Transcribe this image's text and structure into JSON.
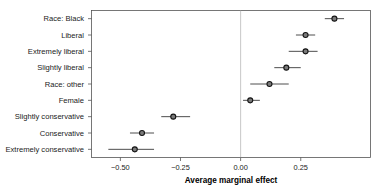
{
  "chart_data": {
    "type": "scatter",
    "title": "",
    "xlabel": "Average marginal effect",
    "ylabel": "",
    "xlim": [
      -0.62,
      0.54
    ],
    "xticks": [
      -0.5,
      -0.25,
      0.0,
      0.25
    ],
    "xticklabels": [
      "−0.50",
      "−0.25",
      "0.00",
      "0.25"
    ],
    "grid": false,
    "legend": null,
    "reference_line": 0.0,
    "orientation": "horizontal",
    "error_bars": "confidence-interval",
    "categories": [
      "Race: Black",
      "Liberal",
      "Extremely liberal",
      "Slightly liberal",
      "Race: other",
      "Female",
      "Slightly conservative",
      "Conservative",
      "Extremely conservative"
    ],
    "values": [
      0.39,
      0.27,
      0.27,
      0.19,
      0.12,
      0.04,
      -0.28,
      -0.41,
      -0.44
    ],
    "ci_low": [
      -0.35,
      0.23,
      0.2,
      0.14,
      0.04,
      0.01,
      -0.33,
      -0.46,
      -0.55
    ],
    "ci_high": [
      0.43,
      0.31,
      0.32,
      0.25,
      0.2,
      0.08,
      -0.21,
      -0.36,
      -0.36
    ],
    "points": [
      {
        "label": "Race: Black",
        "estimate": 0.39,
        "ci_low": 0.35,
        "ci_high": 0.43
      },
      {
        "label": "Liberal",
        "estimate": 0.27,
        "ci_low": 0.23,
        "ci_high": 0.31
      },
      {
        "label": "Extremely liberal",
        "estimate": 0.27,
        "ci_low": 0.2,
        "ci_high": 0.32
      },
      {
        "label": "Slightly liberal",
        "estimate": 0.19,
        "ci_low": 0.14,
        "ci_high": 0.25
      },
      {
        "label": "Race: other",
        "estimate": 0.12,
        "ci_low": 0.04,
        "ci_high": 0.2
      },
      {
        "label": "Female",
        "estimate": 0.04,
        "ci_low": 0.01,
        "ci_high": 0.08
      },
      {
        "label": "Slightly conservative",
        "estimate": -0.28,
        "ci_low": -0.33,
        "ci_high": -0.21
      },
      {
        "label": "Conservative",
        "estimate": -0.41,
        "ci_low": -0.46,
        "ci_high": -0.36
      },
      {
        "label": "Extremely conservative",
        "estimate": -0.44,
        "ci_low": -0.55,
        "ci_high": -0.36
      }
    ],
    "colors": {
      "marker_fill": "#7a7a7a",
      "marker_edge": "#141414",
      "ci_line": "#3a3a3a",
      "frame": "#555555",
      "zero_line": "#b0b0b0",
      "text": "#1a1a1a",
      "background": "#ffffff"
    }
  }
}
